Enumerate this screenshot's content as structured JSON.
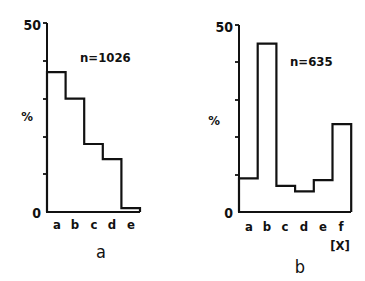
{
  "chart_data": [
    {
      "type": "bar",
      "style": "step-histogram",
      "panel_label": "a",
      "categories": [
        "a",
        "b",
        "c",
        "d",
        "e"
      ],
      "values": [
        37,
        30,
        18,
        14,
        1
      ],
      "annotation": "n=1026",
      "ylabel": "%",
      "xlabel": "",
      "ylim": [
        0,
        50
      ],
      "yticks": [
        0,
        10,
        20,
        30,
        40,
        50
      ],
      "ytick_labels": [
        "0",
        "",
        "",
        "",
        "",
        "50"
      ],
      "grid": false,
      "legend": null
    },
    {
      "type": "bar",
      "style": "step-histogram",
      "panel_label": "b",
      "categories": [
        "a",
        "b",
        "c",
        "d",
        "e",
        "f"
      ],
      "values": [
        9,
        45,
        7,
        5.5,
        8.5,
        23.5
      ],
      "annotation": "n=635",
      "ylabel": "%",
      "xlabel": "[X]",
      "ylim": [
        0,
        50
      ],
      "yticks": [
        0,
        10,
        20,
        30,
        40,
        50
      ],
      "ytick_labels": [
        "0",
        "",
        "",
        "",
        "",
        "50"
      ],
      "grid": false,
      "legend": null
    }
  ],
  "panels": {
    "a": {
      "label": "a",
      "annotation": "n=1026",
      "ylabel": "%",
      "ytop": "50",
      "ybottom": "0",
      "cats": [
        "a",
        "b",
        "c",
        "d",
        "e"
      ]
    },
    "b": {
      "label": "b",
      "annotation": "n=635",
      "ylabel": "%",
      "ytop": "50",
      "ybottom": "0",
      "cats": [
        "a",
        "b",
        "c",
        "d",
        "e",
        "f"
      ],
      "xunit": "[X]"
    }
  }
}
